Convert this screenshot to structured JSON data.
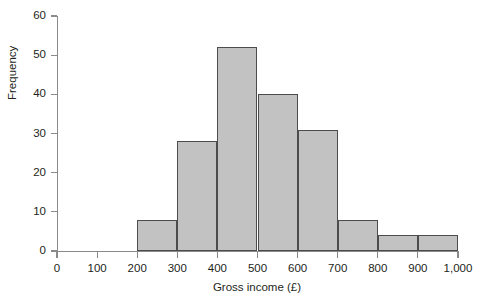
{
  "chart_data": {
    "type": "bar",
    "title": "",
    "xlabel": "Gross income (£)",
    "ylabel": "Frequency",
    "grid": false,
    "legend": false,
    "xlim": [
      0,
      1000
    ],
    "ylim": [
      0,
      60
    ],
    "bin_width": 100,
    "categories": [
      "0–100",
      "100–200",
      "200–300",
      "300–400",
      "400–500",
      "500–600",
      "600–700",
      "700–800",
      "800–900",
      "900–1,000"
    ],
    "bin_edges": [
      0,
      100,
      200,
      300,
      400,
      500,
      600,
      700,
      800,
      900,
      1000
    ],
    "values": [
      0,
      0,
      8,
      28,
      52,
      40,
      31,
      8,
      4,
      4
    ],
    "bars": [
      {
        "label": "200–300",
        "start": 200,
        "end": 300,
        "value": 8
      },
      {
        "label": "300–400",
        "start": 300,
        "end": 400,
        "value": 28
      },
      {
        "label": "400–500",
        "start": 400,
        "end": 500,
        "value": 52
      },
      {
        "label": "500–600",
        "start": 500,
        "end": 600,
        "value": 40
      },
      {
        "label": "600–700",
        "start": 600,
        "end": 700,
        "value": 31
      },
      {
        "label": "700–800",
        "start": 700,
        "end": 800,
        "value": 8
      },
      {
        "label": "800–900",
        "start": 800,
        "end": 900,
        "value": 4
      },
      {
        "label": "900–1,000",
        "start": 900,
        "end": 1000,
        "value": 4
      }
    ],
    "ytick_labels": [
      "0",
      "10",
      "20",
      "30",
      "40",
      "50",
      "60"
    ],
    "ytick_values": [
      0,
      10,
      20,
      30,
      40,
      50,
      60
    ],
    "xtick_labels": [
      "0",
      "100",
      "200",
      "300",
      "400",
      "500",
      "600",
      "700",
      "800",
      "900",
      "1,000"
    ],
    "xtick_values": [
      0,
      100,
      200,
      300,
      400,
      500,
      600,
      700,
      800,
      900,
      1000
    ],
    "colors": {
      "bar_fill": "#c2c2c2",
      "bar_border": "#4c4c4c",
      "axis": "#8a8a8a",
      "text": "#231f20",
      "background": "#ffffff"
    }
  }
}
